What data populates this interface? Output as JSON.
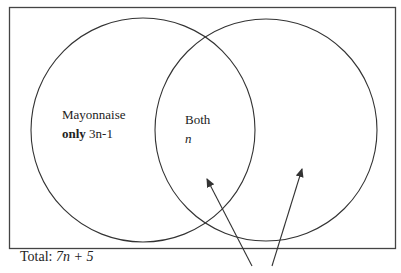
{
  "diagram": {
    "type": "venn",
    "universe_border_color": "#444444",
    "circle_stroke_color": "#333333",
    "regions": {
      "left_only": {
        "line1": "Mayonnaise",
        "line2_bold": "only",
        "line2_value": "3n-1"
      },
      "both": {
        "label": "Both",
        "value": "n"
      }
    },
    "total": {
      "prefix": "Total: ",
      "expression": "7n + 5"
    },
    "arrows": [
      {
        "from": [
          252,
          266
        ],
        "to": [
          207,
          178
        ],
        "points_to": "intersection region"
      },
      {
        "from": [
          272,
          266
        ],
        "to": [
          302,
          168
        ],
        "points_to": "right circle only region"
      }
    ]
  }
}
